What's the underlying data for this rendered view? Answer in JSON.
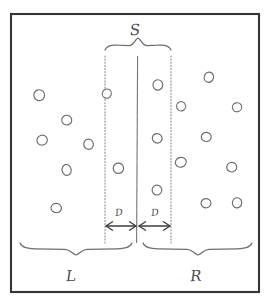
{
  "figure": {
    "style": "hand-drawn pencil sketch, black and white",
    "frame": {
      "name": "outer-border",
      "x": 11,
      "y": 14,
      "width": 248,
      "height": 278,
      "stroke_color": "#35353a"
    },
    "labels": {
      "strip": "S",
      "distance_left": "D",
      "distance_right": "D",
      "region_left": "L",
      "region_right": "R"
    },
    "label_positions": {
      "strip": {
        "x": 135,
        "y": 31
      },
      "distance_left": {
        "x": 119,
        "y": 213
      },
      "distance_right": {
        "x": 155,
        "y": 213
      },
      "region_left": {
        "x": 71,
        "y": 277
      },
      "region_right": {
        "x": 196,
        "y": 277
      }
    },
    "center_line": {
      "name": "separating-hyperplane",
      "x": 137,
      "y_top": 56,
      "y_bottom": 243
    },
    "strip_bounds": {
      "left_x": 105,
      "right_x": 171,
      "y_top": 56,
      "y_bottom": 243,
      "margin_D": 32,
      "width_S": 66
    },
    "top_brace": {
      "x_start": 105,
      "x_end": 171,
      "y": 44,
      "tip_x": 138
    },
    "bottom_braces": [
      {
        "name": "brace-left-L",
        "x_start": 20,
        "x_end": 132,
        "y": 249,
        "tip_x": 76
      },
      {
        "name": "brace-right-R",
        "x_start": 143,
        "x_end": 252,
        "y": 249,
        "tip_x": 198
      }
    ],
    "arrows": [
      {
        "name": "arrow-margin-left",
        "x_from": 106,
        "x_to": 136,
        "y": 226
      },
      {
        "name": "arrow-margin-right",
        "x_from": 139,
        "x_to": 170,
        "y": 226
      }
    ],
    "points": {
      "radius": 5.0,
      "left_region": [
        {
          "x": 39,
          "y": 95
        },
        {
          "x": 67,
          "y": 120
        },
        {
          "x": 42,
          "y": 140
        },
        {
          "x": 89,
          "y": 144
        },
        {
          "x": 67,
          "y": 170
        },
        {
          "x": 56,
          "y": 208
        }
      ],
      "strip_left_half": [
        {
          "x": 107,
          "y": 94
        },
        {
          "x": 118,
          "y": 168
        }
      ],
      "strip_right_half": [
        {
          "x": 158,
          "y": 85
        },
        {
          "x": 157,
          "y": 138
        },
        {
          "x": 157,
          "y": 190
        }
      ],
      "right_region": [
        {
          "x": 209,
          "y": 77
        },
        {
          "x": 181,
          "y": 106
        },
        {
          "x": 237,
          "y": 107
        },
        {
          "x": 206,
          "y": 137
        },
        {
          "x": 181,
          "y": 162
        },
        {
          "x": 232,
          "y": 167
        },
        {
          "x": 206,
          "y": 203
        },
        {
          "x": 237,
          "y": 203
        }
      ]
    },
    "counts": {
      "total_points": 19,
      "left_points": 6,
      "strip_points": 5,
      "right_points": 8
    }
  }
}
